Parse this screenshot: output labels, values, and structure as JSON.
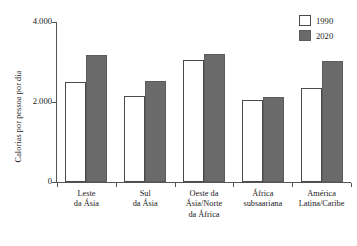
{
  "chart_data": {
    "type": "bar",
    "title": "",
    "xlabel": "",
    "ylabel": "Calorias por pessoa por dia",
    "ylim": [
      0,
      4000
    ],
    "yticks": [
      0,
      2000,
      4000
    ],
    "ytick_labels": [
      "0",
      "2.000",
      "4.000"
    ],
    "grid": false,
    "legend_position": "top-right",
    "categories": [
      "Leste da Ásia",
      "Sul da Ásia",
      "Oeste da Ásia/Norte da África",
      "África subsaariana",
      "América Latina/Caribe"
    ],
    "category_lines": [
      [
        "Leste",
        "da Ásia"
      ],
      [
        "Sul",
        "da Ásia"
      ],
      [
        "Oeste da",
        "Ásia/Norte",
        "da África"
      ],
      [
        "África",
        "subsaariana"
      ],
      [
        "América",
        "Latina/Caribe"
      ]
    ],
    "series": [
      {
        "name": "1990",
        "color": "#ffffff",
        "values": [
          2500,
          2150,
          3060,
          2050,
          2350
        ]
      },
      {
        "name": "2020",
        "color": "#6a6a6a",
        "values": [
          3170,
          2530,
          3190,
          2120,
          3030
        ]
      }
    ]
  },
  "legend": {
    "items": [
      {
        "label": "1990"
      },
      {
        "label": "2020"
      }
    ]
  }
}
